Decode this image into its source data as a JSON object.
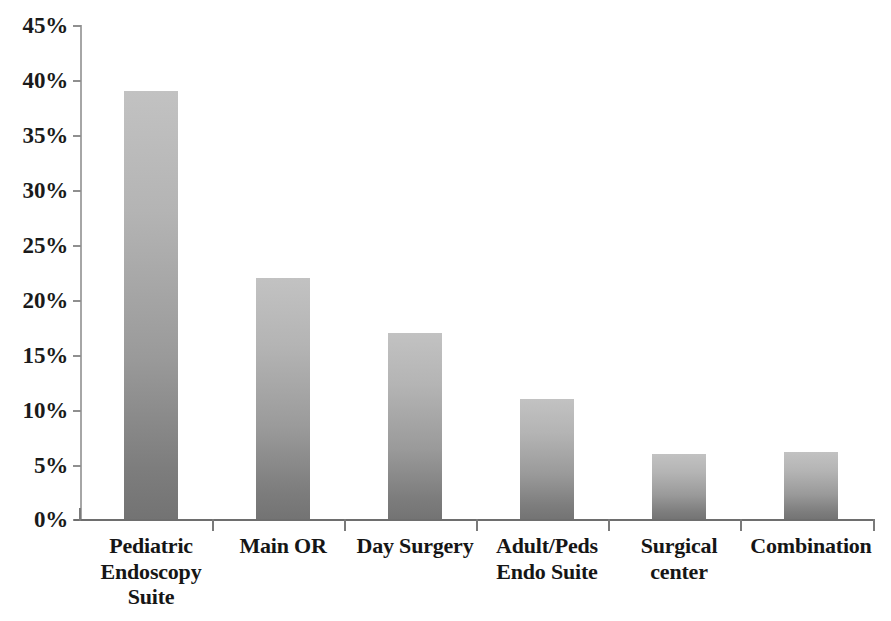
{
  "chart_data": {
    "type": "bar",
    "title": "",
    "subtitle": "",
    "xlabel": "",
    "ylabel": "",
    "categories": [
      "Pediatric Endoscopy Suite",
      "Main OR",
      "Day Surgery",
      "Adult/Peds Endo Suite",
      "Surgical center",
      "Combination"
    ],
    "category_lines": [
      [
        "Pediatric",
        "Endoscopy",
        "Suite"
      ],
      [
        "Main OR"
      ],
      [
        "Day Surgery"
      ],
      [
        "Adult/Peds",
        "Endo Suite"
      ],
      [
        "Surgical",
        "center"
      ],
      [
        "Combination"
      ]
    ],
    "values": [
      39,
      22,
      17,
      11,
      6,
      6.2
    ],
    "value_labels": [
      "39%",
      "22%",
      "17%",
      "11%",
      "6%",
      "6%"
    ],
    "ylim": [
      0,
      45
    ],
    "ytick_values": [
      45,
      40,
      35,
      30,
      25,
      20,
      15,
      10,
      5,
      0
    ],
    "ytick_labels": [
      "45%",
      "40%",
      "35%",
      "30%",
      "25%",
      "20%",
      "15%",
      "10%",
      "5%",
      "0%"
    ],
    "grid": false,
    "legend": false,
    "legend_position": "none",
    "bar_color_top": "#c2c2c2",
    "bar_color_bottom": "#737373",
    "axis_color": "#8f8f8f",
    "text_color": "#161616"
  }
}
